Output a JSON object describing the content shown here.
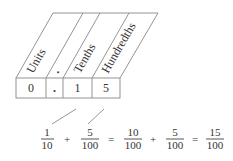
{
  "diagram": {
    "headers": [
      {
        "label": "Units"
      },
      {
        "label": "."
      },
      {
        "label": "Tenths"
      },
      {
        "label": "Hundredths"
      }
    ],
    "digits": [
      "0",
      ".",
      "1",
      "5"
    ],
    "equation": {
      "terms": [
        {
          "num": "1",
          "den": "10"
        },
        {
          "num": "5",
          "den": "100"
        },
        {
          "num": "10",
          "den": "100"
        },
        {
          "num": "5",
          "den": "100"
        },
        {
          "num": "15",
          "den": "100"
        }
      ],
      "operators": [
        "+",
        "=",
        "+",
        "="
      ]
    },
    "colors": {
      "line": "#888888",
      "text": "#333333"
    }
  }
}
